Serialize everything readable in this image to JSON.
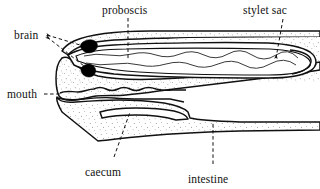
{
  "figure": {
    "kind": "anatomical-line-diagram",
    "background_color": "#ffffff",
    "ink_color": "#111111",
    "stipple_color": "#3a3a3a",
    "organ_fill": "#000000"
  },
  "labels": {
    "brain": "brain",
    "proboscis": "proboscis",
    "stylet_sac": "stylet sac",
    "mouth": "mouth",
    "caecum": "caecum",
    "intestine": "intestine"
  },
  "leaders": {
    "brain": {
      "style": "dashed",
      "arrowheads": 2,
      "direction": "right-down"
    },
    "proboscis": {
      "style": "dashed",
      "arrowheads": 0,
      "direction": "down"
    },
    "stylet_sac": {
      "style": "dashed",
      "arrowheads": 1,
      "direction": "down-left"
    },
    "mouth": {
      "style": "dashed",
      "arrowheads": 0,
      "direction": "right"
    },
    "caecum": {
      "style": "dashed",
      "arrowheads": 0,
      "direction": "up-right"
    },
    "intestine": {
      "style": "dashed",
      "arrowheads": 0,
      "direction": "up"
    }
  },
  "structures": [
    {
      "name": "proboscis",
      "description": "long tapering tube with wavy internal lining running the length of the body, terminating in a rounded loop at the posterior right"
    },
    {
      "name": "stylet sac",
      "description": "bulbous rounded terminus at the right end of the proboscis"
    },
    {
      "name": "brain",
      "description": "two solid black ganglia lobes near the anterior tip"
    },
    {
      "name": "mouth",
      "description": "opening at the left beneath the proboscis with a scalloped margin"
    },
    {
      "name": "caecum",
      "description": "blind sac extending posteriorly below the proboscis"
    },
    {
      "name": "intestine",
      "description": "broad band of gut running along the lower body to the right margin"
    }
  ]
}
